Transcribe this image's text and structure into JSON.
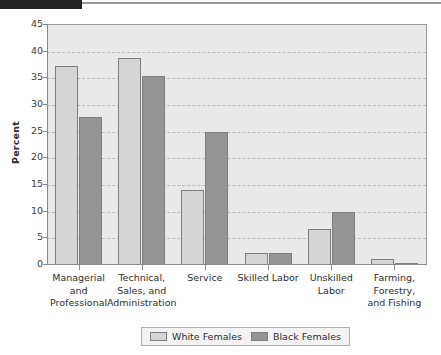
{
  "chart_data": {
    "type": "bar",
    "title": "",
    "subtitle": "",
    "xlabel": "",
    "ylabel": "Percent",
    "ylim": [
      0,
      45
    ],
    "ytick_step": 5,
    "yticks": [
      "45",
      "40",
      "35",
      "30",
      "25",
      "20",
      "15",
      "10",
      "5",
      "0"
    ],
    "grid": true,
    "legend_position": "bottom-center",
    "categories": [
      "Managerial\nand\nProfessional",
      "Technical,\nSales, and\nAdministration",
      "Service",
      "Skilled Labor",
      "Unskilled\nLabor",
      "Farming,\nForestry,\nand Fishing"
    ],
    "series": [
      {
        "name": "White Females",
        "color": "#d5d5d5",
        "values": [
          37.3,
          38.9,
          14.0,
          2.3,
          6.7,
          1.2
        ]
      },
      {
        "name": "Black Females",
        "color": "#959595",
        "values": [
          27.7,
          35.4,
          25.0,
          2.3,
          9.9,
          0.2
        ]
      }
    ]
  },
  "legend": {
    "entries": [
      {
        "label": "White Females",
        "swatch": "white-f"
      },
      {
        "label": "Black Females",
        "swatch": "black-f"
      }
    ]
  },
  "colors": {
    "plot_background": "#e9e9e9",
    "gridline": "#b9b9b9",
    "axis": "#8a8a8a",
    "bar_border": "#7e7e7e",
    "white_females_fill": "#d5d5d5",
    "black_females_fill": "#959595",
    "top_bar": "#232323"
  }
}
